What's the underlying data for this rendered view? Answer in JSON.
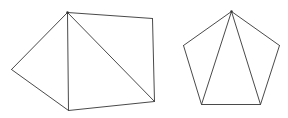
{
  "canvas": {
    "width": 288,
    "height": 118,
    "background": "#ffffff",
    "stroke": "#4a4a4a"
  },
  "figures": [
    {
      "name": "pentagon-with-diagonals-left",
      "vertices": {
        "top": [
          67,
          12
        ],
        "top_right": [
          152,
          18
        ],
        "bottom_right": [
          154,
          101
        ],
        "bottom": [
          68,
          110
        ],
        "left": [
          11,
          69
        ]
      },
      "edges": [
        [
          "top",
          "top_right"
        ],
        [
          "top_right",
          "bottom_right"
        ],
        [
          "bottom_right",
          "bottom"
        ],
        [
          "bottom",
          "left"
        ],
        [
          "left",
          "top"
        ],
        [
          "top",
          "bottom"
        ],
        [
          "top",
          "bottom_right"
        ]
      ]
    },
    {
      "name": "regular-pentagon-right",
      "vertices": {
        "top": [
          231,
          11
        ],
        "right": [
          279,
          45
        ],
        "bottom_right": [
          260,
          104
        ],
        "bottom_left": [
          201,
          104
        ],
        "left": [
          183,
          45
        ]
      },
      "edges": [
        [
          "top",
          "right"
        ],
        [
          "right",
          "bottom_right"
        ],
        [
          "bottom_right",
          "bottom_left"
        ],
        [
          "bottom_left",
          "left"
        ],
        [
          "left",
          "top"
        ],
        [
          "top",
          "bottom_left"
        ],
        [
          "top",
          "bottom_right"
        ]
      ]
    }
  ]
}
